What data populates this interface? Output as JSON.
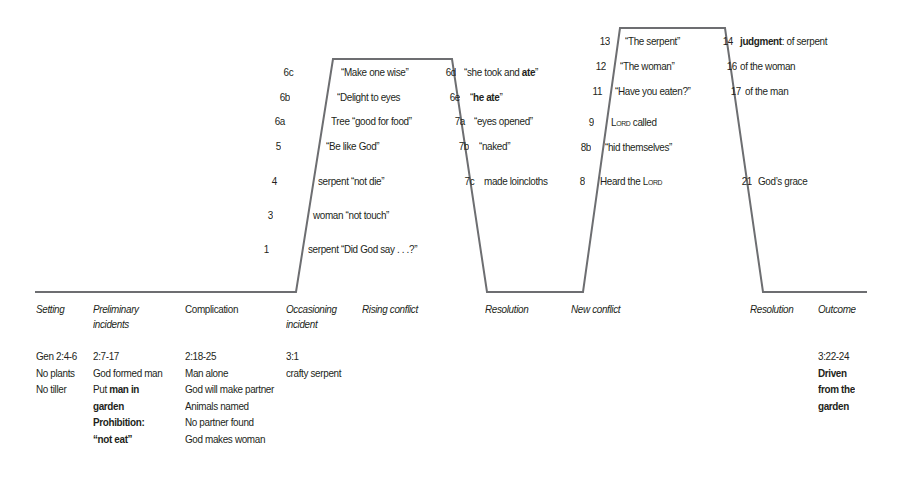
{
  "curve": {
    "stroke": "#6d6e71",
    "points": [
      [
        35,
        292
      ],
      [
        296,
        292
      ],
      [
        333,
        59
      ],
      [
        452,
        59
      ],
      [
        487,
        292
      ],
      [
        583,
        292
      ],
      [
        620,
        28
      ],
      [
        725,
        28
      ],
      [
        763,
        292
      ],
      [
        867,
        292
      ]
    ]
  },
  "rising1": [
    {
      "num": "6c",
      "text": "“Make one wise”"
    },
    {
      "num": "6b",
      "text": "“Delight to eyes"
    },
    {
      "num": "6a",
      "text": "Tree “good for food”"
    },
    {
      "num": "5",
      "text": "“Be like God”"
    },
    {
      "num": "4",
      "text": "serpent “not die”"
    },
    {
      "num": "3",
      "text": "woman “not touch”"
    },
    {
      "num": "1",
      "text": "serpent “Did God say . . .?”"
    }
  ],
  "falling1": [
    {
      "num": "6d",
      "text_pre": "“she took and ",
      "text_bold": "ate",
      "text_post": "”"
    },
    {
      "num": "6e",
      "text_pre": "“",
      "text_bold": "he ate",
      "text_post": "”"
    },
    {
      "num": "7a",
      "text": "“eyes opened”"
    },
    {
      "num": "7b",
      "text": "“naked”"
    },
    {
      "num": "7c",
      "text": "made loincloths"
    }
  ],
  "rising2": [
    {
      "num": "13",
      "text": "“The serpent”"
    },
    {
      "num": "12",
      "text": "“The woman”"
    },
    {
      "num": "11",
      "text": "“Have you eaten?”"
    },
    {
      "num": "9",
      "text_sc": "Lord",
      "text_post": " called"
    },
    {
      "num": "8b",
      "text": "“hid themselves”"
    },
    {
      "num": "8",
      "text_pre": "Heard the ",
      "text_sc": "Lord"
    }
  ],
  "falling2": [
    {
      "num": "14",
      "text_bold": "judgment",
      "text_post": ": of serpent"
    },
    {
      "num": "16",
      "text": "of the woman"
    },
    {
      "num": "17",
      "text": "of the man"
    },
    {
      "num": "21",
      "text": "God’s grace"
    }
  ],
  "stages": [
    {
      "label": "Setting"
    },
    {
      "label": "Preliminary incidents"
    },
    {
      "label": "Complication"
    },
    {
      "label": "Occasioning incident"
    },
    {
      "label": "Rising conflict"
    },
    {
      "label": "Resolution"
    },
    {
      "label": "New conflict"
    },
    {
      "label": "Resolution"
    },
    {
      "label": "Outcome"
    }
  ],
  "columns": {
    "setting": [
      "Gen 2:4-6",
      "No plants",
      "No tiller"
    ],
    "preliminary": {
      "ref": "2:7-17",
      "line1": "God formed man",
      "line2_pre": "Put ",
      "line2_bold": "man in",
      "line3_bold": "garden",
      "line4_bold": "Prohibition:",
      "line5_bold": "“not eat”"
    },
    "complication": [
      "2:18-25",
      "Man alone",
      "God will make partner",
      "Animals named",
      "No partner found",
      "God makes woman"
    ],
    "occasioning": [
      "3:1",
      "crafty serpent"
    ],
    "outcome": {
      "ref": "3:22-24",
      "bold": [
        "Driven",
        "from the",
        "garden"
      ]
    }
  }
}
